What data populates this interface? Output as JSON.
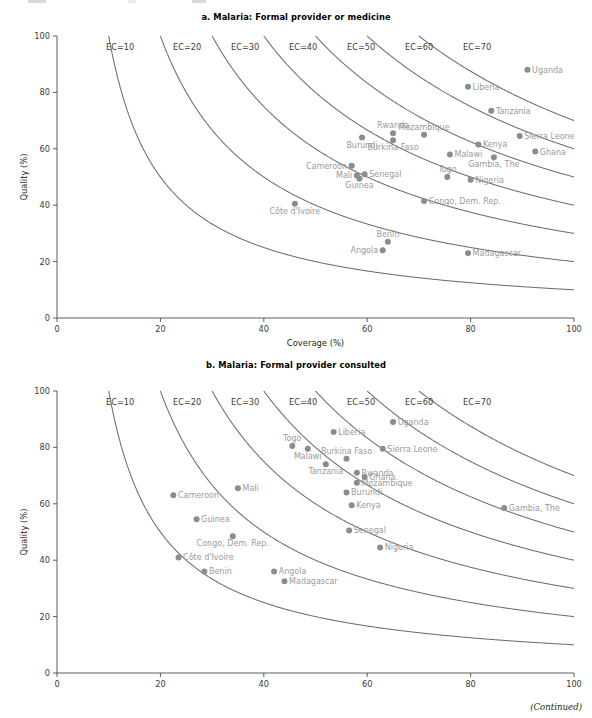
{
  "figure": {
    "continued_note": "(Continued)",
    "dot_color": "#8c8c8c",
    "label_color": "#9a9a9a",
    "curve_color": "#6e6e6e"
  },
  "panels": [
    {
      "id": "a",
      "title": "a. Malaria: Formal provider or medicine",
      "chart_data": {
        "type": "scatter",
        "title": "a. Malaria: Formal provider or medicine",
        "xlabel": "Coverage (%)",
        "ylabel": "Quality (%)",
        "xlim": [
          0,
          100
        ],
        "ylim": [
          0,
          100
        ],
        "xticks": [
          0,
          20,
          40,
          60,
          80,
          100
        ],
        "yticks": [
          0,
          20,
          40,
          60,
          80,
          100
        ],
        "grid": false,
        "legend": "none",
        "annotations": [
          "EC=10",
          "EC=20",
          "EC=30",
          "EC=40",
          "EC=50",
          "EC=60",
          "EC=70"
        ],
        "iso_curves": {
          "label_prefix": "EC=",
          "values": [
            10,
            20,
            30,
            40,
            50,
            60,
            70
          ],
          "definition": "Quality x Coverage / 100 = EC"
        },
        "points": [
          {
            "name": "Uganda",
            "x": 91.0,
            "y": 88.0,
            "label_side": "right"
          },
          {
            "name": "Liberia",
            "x": 79.5,
            "y": 82.0,
            "label_side": "right"
          },
          {
            "name": "Tanzania",
            "x": 84.0,
            "y": 73.5,
            "label_side": "right"
          },
          {
            "name": "Sierra Leone",
            "x": 89.5,
            "y": 64.5,
            "label_side": "right"
          },
          {
            "name": "Rwanda",
            "x": 65.0,
            "y": 65.5,
            "label_side": "above"
          },
          {
            "name": "Mozambique",
            "x": 71.0,
            "y": 65.0,
            "label_side": "above"
          },
          {
            "name": "Burundi",
            "x": 59.0,
            "y": 64.0,
            "label_side": "below"
          },
          {
            "name": "Burkina Faso",
            "x": 65.0,
            "y": 63.0,
            "label_side": "below"
          },
          {
            "name": "Kenya",
            "x": 81.5,
            "y": 61.5,
            "label_side": "right"
          },
          {
            "name": "Ghana",
            "x": 92.5,
            "y": 59.0,
            "label_side": "right"
          },
          {
            "name": "Malawi",
            "x": 76.0,
            "y": 58.0,
            "label_side": "right"
          },
          {
            "name": "Gambia, The",
            "x": 84.5,
            "y": 57.0,
            "label_side": "below"
          },
          {
            "name": "Cameroon",
            "x": 57.0,
            "y": 54.0,
            "label_side": "left"
          },
          {
            "name": "Mali",
            "x": 58.0,
            "y": 50.5,
            "label_side": "left"
          },
          {
            "name": "Senegal",
            "x": 59.5,
            "y": 51.0,
            "label_side": "right"
          },
          {
            "name": "Guinea",
            "x": 58.5,
            "y": 49.5,
            "label_side": "below"
          },
          {
            "name": "Togo",
            "x": 75.5,
            "y": 50.0,
            "label_side": "above"
          },
          {
            "name": "Nigeria",
            "x": 80.0,
            "y": 49.0,
            "label_side": "right"
          },
          {
            "name": "Congo, Dem. Rep.",
            "x": 71.0,
            "y": 41.5,
            "label_side": "right"
          },
          {
            "name": "Côte d'Ivoire",
            "x": 46.0,
            "y": 40.5,
            "label_side": "below"
          },
          {
            "name": "Benin",
            "x": 64.0,
            "y": 27.0,
            "label_side": "above"
          },
          {
            "name": "Angola",
            "x": 63.0,
            "y": 24.0,
            "label_side": "left"
          },
          {
            "name": "Madagascar",
            "x": 79.5,
            "y": 23.0,
            "label_side": "right"
          }
        ]
      }
    },
    {
      "id": "b",
      "title": "b. Malaria: Formal provider consulted",
      "chart_data": {
        "type": "scatter",
        "title": "b. Malaria: Formal provider consulted",
        "xlabel": "Coverage (%)",
        "ylabel": "Quality (%)",
        "xlim": [
          0,
          100
        ],
        "ylim": [
          0,
          100
        ],
        "xticks": [
          0,
          20,
          40,
          60,
          80,
          100
        ],
        "yticks": [
          0,
          20,
          40,
          60,
          80,
          100
        ],
        "grid": false,
        "legend": "none",
        "annotations": [
          "EC=10",
          "EC=20",
          "EC=30",
          "EC=40",
          "EC=50",
          "EC=60",
          "EC=70"
        ],
        "iso_curves": {
          "label_prefix": "EC=",
          "values": [
            10,
            20,
            30,
            40,
            50,
            60,
            70
          ],
          "definition": "Quality x Coverage / 100 = EC"
        },
        "points": [
          {
            "name": "Uganda",
            "x": 65.0,
            "y": 89.0,
            "label_side": "right"
          },
          {
            "name": "Liberia",
            "x": 53.5,
            "y": 85.5,
            "label_side": "right"
          },
          {
            "name": "Togo",
            "x": 45.5,
            "y": 80.5,
            "label_side": "above"
          },
          {
            "name": "Sierra Leone",
            "x": 63.0,
            "y": 79.5,
            "label_side": "right"
          },
          {
            "name": "Malawi",
            "x": 48.5,
            "y": 79.5,
            "label_side": "below"
          },
          {
            "name": "Burkina Faso",
            "x": 56.0,
            "y": 76.0,
            "label_side": "above"
          },
          {
            "name": "Tanzania",
            "x": 52.0,
            "y": 74.0,
            "label_side": "below"
          },
          {
            "name": "Rwanda",
            "x": 58.0,
            "y": 71.0,
            "label_side": "right"
          },
          {
            "name": "Ghana",
            "x": 59.5,
            "y": 69.5,
            "label_side": "right"
          },
          {
            "name": "Mozambique",
            "x": 58.0,
            "y": 67.5,
            "label_side": "right"
          },
          {
            "name": "Mali",
            "x": 35.0,
            "y": 65.5,
            "label_side": "right"
          },
          {
            "name": "Burundi",
            "x": 56.0,
            "y": 64.0,
            "label_side": "right"
          },
          {
            "name": "Cameroon",
            "x": 22.5,
            "y": 63.0,
            "label_side": "right"
          },
          {
            "name": "Kenya",
            "x": 57.0,
            "y": 59.5,
            "label_side": "right"
          },
          {
            "name": "Gambia, The",
            "x": 86.5,
            "y": 58.5,
            "label_side": "right"
          },
          {
            "name": "Guinea",
            "x": 27.0,
            "y": 54.5,
            "label_side": "right"
          },
          {
            "name": "Senegal",
            "x": 56.5,
            "y": 50.5,
            "label_side": "right"
          },
          {
            "name": "Congo, Dem. Rep.",
            "x": 34.0,
            "y": 48.5,
            "label_side": "below"
          },
          {
            "name": "Nigeria",
            "x": 62.5,
            "y": 44.5,
            "label_side": "right"
          },
          {
            "name": "Côte d'Ivoire",
            "x": 23.5,
            "y": 41.0,
            "label_side": "right"
          },
          {
            "name": "Benin",
            "x": 28.5,
            "y": 36.0,
            "label_side": "right"
          },
          {
            "name": "Angola",
            "x": 42.0,
            "y": 36.0,
            "label_side": "right"
          },
          {
            "name": "Madagascar",
            "x": 44.0,
            "y": 32.5,
            "label_side": "right"
          }
        ]
      }
    }
  ]
}
